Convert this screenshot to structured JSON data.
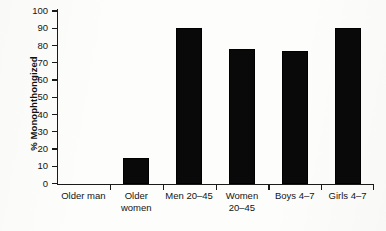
{
  "chart_data": {
    "type": "bar",
    "title": "",
    "xlabel": "",
    "ylabel": "% Monophthongized",
    "ylim": [
      0,
      100
    ],
    "yticks": [
      0,
      10,
      20,
      30,
      40,
      50,
      60,
      70,
      80,
      90,
      100
    ],
    "grid": false,
    "legend": null,
    "bar_color": "#090909",
    "background_color": "#fdfdfc",
    "axis_color": "#1a1a1a",
    "categories": [
      "Older man",
      "Older women",
      "Men 20–45",
      "Women 20–45",
      "Boys 4–7",
      "Girls 4–7"
    ],
    "category_lines": [
      [
        "Older man"
      ],
      [
        "Older",
        "women"
      ],
      [
        "Men 20–45"
      ],
      [
        "Women",
        "20–45"
      ],
      [
        "Boys 4–7"
      ],
      [
        "Girls 4–7"
      ]
    ],
    "values": [
      0,
      15,
      90,
      78,
      77,
      90
    ]
  }
}
